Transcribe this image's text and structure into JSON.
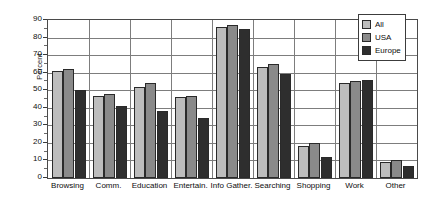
{
  "chart_data": {
    "type": "bar",
    "title": "",
    "xlabel": "",
    "ylabel": "Percent",
    "ylim": [
      0,
      90
    ],
    "ytick_step": 10,
    "yticks": [
      0,
      10,
      20,
      30,
      40,
      50,
      60,
      70,
      80,
      90
    ],
    "grid": true,
    "grid_axis": "both",
    "legend_position": "top-right",
    "categories": [
      "Browsing",
      "Comm.",
      "Education",
      "Entertain.",
      "Info Gather.",
      "Searching",
      "Shopping",
      "Work",
      "Other"
    ],
    "series": [
      {
        "name": "All",
        "color": "#bdbdbd",
        "values": [
          61,
          47,
          52,
          46,
          86,
          63,
          18,
          54,
          9
        ]
      },
      {
        "name": "USA",
        "color": "#8a8a8a",
        "values": [
          62,
          48,
          54,
          47,
          87,
          65,
          20,
          55,
          10
        ]
      },
      {
        "name": "Europe",
        "color": "#2e2e2e",
        "values": [
          50,
          41,
          38,
          34,
          85,
          59,
          12,
          56,
          7
        ]
      }
    ]
  },
  "legend": {
    "entries": [
      {
        "label": "All"
      },
      {
        "label": "USA"
      },
      {
        "label": "Europe"
      }
    ]
  }
}
